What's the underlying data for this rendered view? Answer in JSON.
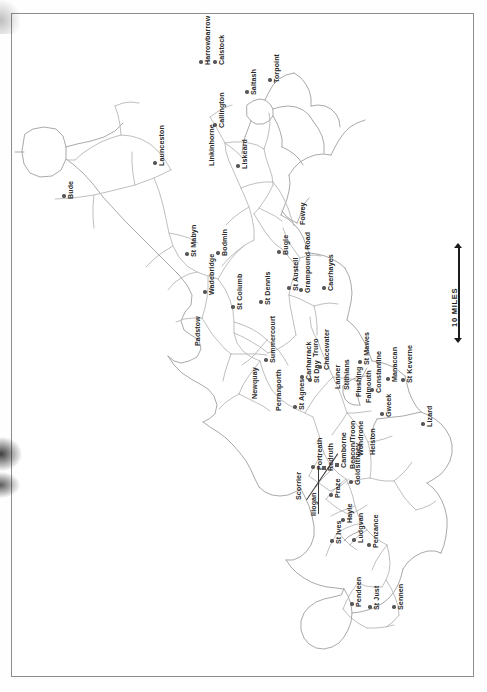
{
  "document": {
    "kind": "scanned-map-page",
    "region_title": "Cornwall",
    "orientation": "rotated-90-counterclockwise",
    "background_color": "#ffffff",
    "frame_color": "#8d8d8d",
    "road_color": "#b3b3b3",
    "coast_color": "#9a9a9a",
    "marker_color": "#575757",
    "label_color": "#2a2a2a"
  },
  "scale": {
    "label": "10 MILES",
    "arrow_top": "▲",
    "arrow_bottom": "▼"
  },
  "places": [
    {
      "name": "Bude",
      "x": 64,
      "y": 196,
      "marker": "dot"
    },
    {
      "name": "Launceston",
      "x": 155,
      "y": 163,
      "marker": "dot"
    },
    {
      "name": "Harrowbarrow",
      "x": 201,
      "y": 62,
      "marker": "dot"
    },
    {
      "name": "Calstock",
      "x": 215,
      "y": 62,
      "marker": "dot"
    },
    {
      "name": "Callington",
      "x": 215,
      "y": 125,
      "marker": "dot"
    },
    {
      "name": "Saltash",
      "x": 247,
      "y": 92,
      "marker": "dot"
    },
    {
      "name": "Torpoint",
      "x": 270,
      "y": 80,
      "marker": "dot"
    },
    {
      "name": "Linkinhorne",
      "x": 205,
      "y": 163,
      "marker": "none"
    },
    {
      "name": "Liskeard",
      "x": 238,
      "y": 166,
      "marker": "dot"
    },
    {
      "name": "St Mabyn",
      "x": 187,
      "y": 254,
      "marker": "dot"
    },
    {
      "name": "Bodmin",
      "x": 218,
      "y": 253,
      "marker": "dot"
    },
    {
      "name": "Wadebridge",
      "x": 205,
      "y": 292,
      "marker": "dot"
    },
    {
      "name": "Padstow",
      "x": 191,
      "y": 343,
      "marker": "none"
    },
    {
      "name": "St Columb",
      "x": 233,
      "y": 307,
      "marker": "dot"
    },
    {
      "name": "St Dennis",
      "x": 261,
      "y": 302,
      "marker": "dot"
    },
    {
      "name": "Bugle",
      "x": 279,
      "y": 252,
      "marker": "dot"
    },
    {
      "name": "Fowey",
      "x": 296,
      "y": 222,
      "marker": "none"
    },
    {
      "name": "St Austell",
      "x": 289,
      "y": 288,
      "marker": "dot"
    },
    {
      "name": "Grampound Road",
      "x": 301,
      "y": 290,
      "marker": "dot"
    },
    {
      "name": "Caerhayes",
      "x": 324,
      "y": 288,
      "marker": "dot"
    },
    {
      "name": "Newquay",
      "x": 248,
      "y": 396,
      "marker": "none"
    },
    {
      "name": "Summercourt",
      "x": 266,
      "y": 360,
      "marker": "dot"
    },
    {
      "name": "Perranporth",
      "x": 272,
      "y": 408,
      "marker": "none"
    },
    {
      "name": "St Agnes",
      "x": 295,
      "y": 407,
      "marker": "dot"
    },
    {
      "name": "Carharrack",
      "x": 302,
      "y": 377,
      "marker": "dot"
    },
    {
      "name": "St Day",
      "x": 310,
      "y": 380,
      "marker": "dot"
    },
    {
      "name": "Truro",
      "x": 309,
      "y": 354,
      "marker": "none"
    },
    {
      "name": "Chacewater",
      "x": 320,
      "y": 367,
      "marker": "dot"
    },
    {
      "name": "Lanner",
      "x": 331,
      "y": 386,
      "marker": "none"
    },
    {
      "name": "Stithians",
      "x": 340,
      "y": 387,
      "marker": "none"
    },
    {
      "name": "St Mawes",
      "x": 360,
      "y": 362,
      "marker": "dot"
    },
    {
      "name": "Flushing",
      "x": 352,
      "y": 394,
      "marker": "none"
    },
    {
      "name": "Falmouth",
      "x": 362,
      "y": 400,
      "marker": "none"
    },
    {
      "name": "Constantine",
      "x": 372,
      "y": 390,
      "marker": "dot"
    },
    {
      "name": "Manaccan",
      "x": 388,
      "y": 379,
      "marker": "dot"
    },
    {
      "name": "St Keverne",
      "x": 403,
      "y": 380,
      "marker": "dot"
    },
    {
      "name": "Gweek",
      "x": 382,
      "y": 414,
      "marker": "dot"
    },
    {
      "name": "Lizard",
      "x": 423,
      "y": 424,
      "marker": "dot"
    },
    {
      "name": "Helston",
      "x": 366,
      "y": 452,
      "marker": "none"
    },
    {
      "name": "Wendrone",
      "x": 354,
      "y": 453,
      "marker": "none"
    },
    {
      "name": "Scorrier",
      "x": 292,
      "y": 497,
      "marker": "none"
    },
    {
      "name": "Illogan",
      "x": 307,
      "y": 513,
      "marker": "none"
    },
    {
      "name": "Portreath",
      "x": 313,
      "y": 467,
      "marker": "dot"
    },
    {
      "name": "Redruth",
      "x": 324,
      "y": 468,
      "marker": "sq"
    },
    {
      "name": "Camborne",
      "x": 337,
      "y": 465,
      "marker": "sq"
    },
    {
      "name": "Beacon/Troon",
      "x": 346,
      "y": 466,
      "marker": "none"
    },
    {
      "name": "Praze",
      "x": 331,
      "y": 495,
      "marker": "dot"
    },
    {
      "name": "Goldsithney",
      "x": 351,
      "y": 482,
      "marker": "dot"
    },
    {
      "name": "Hayle",
      "x": 343,
      "y": 520,
      "marker": "dot"
    },
    {
      "name": "St Ives",
      "x": 332,
      "y": 541,
      "marker": "dot"
    },
    {
      "name": "Ludgvan",
      "x": 354,
      "y": 540,
      "marker": "dot"
    },
    {
      "name": "Penzance",
      "x": 369,
      "y": 545,
      "marker": "dot"
    },
    {
      "name": "Pendeen",
      "x": 352,
      "y": 604,
      "marker": "dot"
    },
    {
      "name": "St Just",
      "x": 370,
      "y": 607,
      "marker": "dot"
    },
    {
      "name": "Sennen",
      "x": 394,
      "y": 607,
      "marker": "dot"
    }
  ],
  "map_geometry": {
    "coastline": "M 52 193 L 40 186 L 33 176 L 31 160 L 38 150 L 52 146 L 68 149 L 79 157 L 83 170 L 80 182 L 70 190 Z",
    "note": "Cornwall peninsula outline rendered as SVG paths in template"
  }
}
